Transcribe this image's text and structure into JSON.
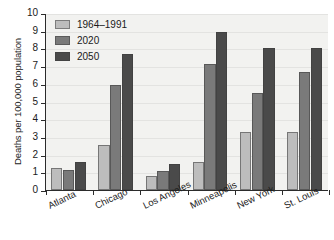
{
  "chart_data": {
    "type": "bar",
    "title": "",
    "subtitle": "",
    "xlabel": "",
    "ylabel": "Deaths per 100,000 population",
    "categories": [
      "Atlanta",
      "Chicago",
      "Los Angeles",
      "Minneapolis",
      "New York",
      "St. Louis"
    ],
    "series": [
      {
        "name": "1964–1991",
        "color": "#bdbdbd",
        "values": [
          1.25,
          2.55,
          0.8,
          1.6,
          3.3,
          3.25
        ]
      },
      {
        "name": "2020",
        "color": "#7a7a7a",
        "values": [
          1.15,
          5.95,
          1.1,
          7.1,
          5.5,
          6.65
        ]
      },
      {
        "name": "2050",
        "color": "#4a4a4a",
        "values": [
          1.6,
          7.7,
          1.45,
          8.9,
          8.05,
          8.05
        ]
      }
    ],
    "ylim": [
      0,
      10
    ],
    "yticks": [
      0,
      1,
      2,
      3,
      4,
      5,
      6,
      7,
      8,
      9,
      10
    ],
    "ytick_labels": [
      "0",
      "1",
      "2",
      "3",
      "4",
      "5",
      "6",
      "7",
      "8",
      "9",
      "10"
    ],
    "grid": false,
    "legend_position": "top-left",
    "plot_background": "#f2f2f0",
    "axis_color": "#2b2b2b"
  }
}
